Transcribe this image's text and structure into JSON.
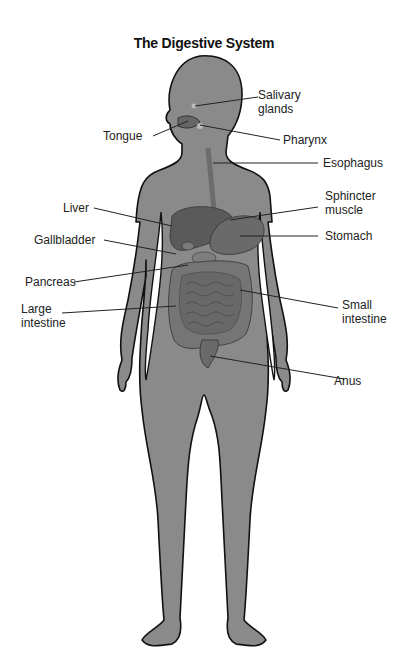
{
  "title": "The Digestive System",
  "colors": {
    "body_fill": "#8a8a8a",
    "outline": "#111111",
    "organ_dark": "#5a5a5a",
    "organ_mid": "#747474",
    "leader_line": "#222222",
    "background": "#ffffff"
  },
  "labels": {
    "salivary_glands": [
      "Salivary",
      "glands"
    ],
    "tongue": "Tongue",
    "pharynx": "Pharynx",
    "esophagus": "Esophagus",
    "sphincter_muscle": [
      "Sphincter",
      "muscle"
    ],
    "liver": "Liver",
    "stomach": "Stomach",
    "gallbladder": "Gallbladder",
    "pancreas": "Pancreas",
    "large_intestine": [
      "Large",
      "intestine"
    ],
    "small_intestine": [
      "Small",
      "intestine"
    ],
    "anus": "Anus"
  }
}
